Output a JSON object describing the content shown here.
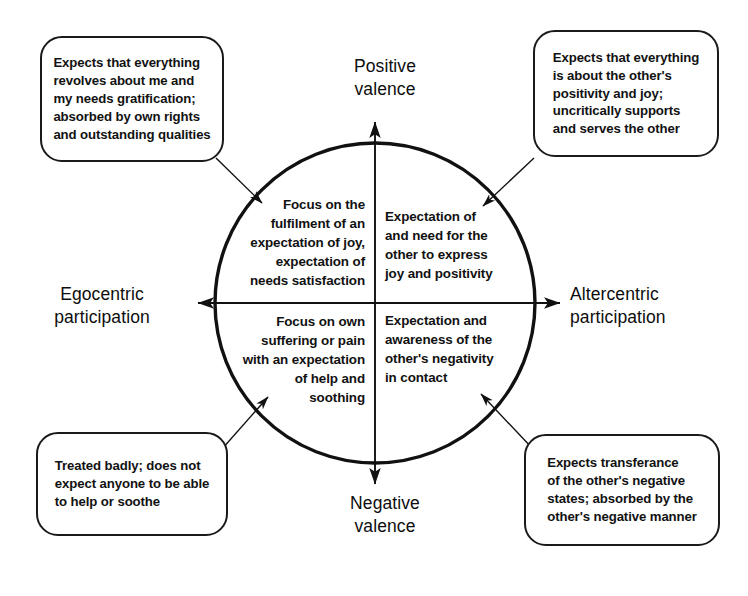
{
  "diagram": {
    "axes": {
      "vertical_top_label": "Positive\nvalence",
      "vertical_bottom_label": "Negative\nvalence",
      "horizontal_left_label": "Egocentric\nparticipation",
      "horizontal_right_label": "Altercentric\nparticipation"
    },
    "quadrants": [
      {
        "id": "top-left",
        "position": "egocentric-positive",
        "text": "Focus on the\nfulfilment of an\nexpectation of joy,\nexpectation of\nneeds satisfaction"
      },
      {
        "id": "top-right",
        "position": "altercentric-positive",
        "text": "Expectation of\nand need for the\nother to express\njoy and positivity"
      },
      {
        "id": "bottom-left",
        "position": "egocentric-negative",
        "text": "Focus on own\nsuffering or pain\nwith an expectation\nof help and\nsoothing"
      },
      {
        "id": "bottom-right",
        "position": "altercentric-negative",
        "text": "Expectation and\nawareness of the\nother's negativity\nin contact"
      }
    ],
    "callouts": [
      {
        "id": "top-left",
        "text": "Expects that everything\nrevolves about me and\nmy needs gratification;\nabsorbed by own rights\nand outstanding qualities"
      },
      {
        "id": "top-right",
        "text": "Expects that everything\nis about the other's\npositivity and joy;\nuncritically supports\nand serves the other"
      },
      {
        "id": "bottom-left",
        "text": "Treated badly; does not\nexpect anyone to be able\nto help or soothe"
      },
      {
        "id": "bottom-right",
        "text": "Expects transferance\nof the other's negative\nstates; absorbed by the\nother's negative manner"
      }
    ],
    "style": {
      "stroke": "#111111",
      "background": "#ffffff",
      "circle_center_x": 375,
      "circle_center_y": 303,
      "circle_radius": 160
    }
  }
}
